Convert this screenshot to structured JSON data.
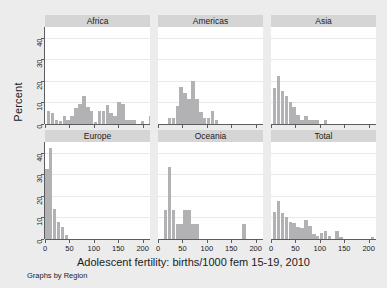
{
  "chart_data": {
    "type": "bar",
    "title": "",
    "xlabel": "Adolescent fertility: births/1000 fem 15-19, 2010",
    "ylabel": "Percent",
    "note": "Graphs by Region",
    "xlim": [
      0,
      215
    ],
    "ylim": [
      0,
      45
    ],
    "xticks": [
      0,
      50,
      100,
      150,
      200
    ],
    "xtick_labels": [
      "0",
      "50",
      "100",
      "150",
      "200"
    ],
    "yticks": [
      0,
      10,
      20,
      30,
      40
    ],
    "ytick_labels": [
      "0",
      "10",
      "20",
      "30",
      "40"
    ],
    "grid": true,
    "legend": "none",
    "layout": "2 rows x 3 columns of small-multiple histograms, shared axes, gray title strip above each panel",
    "bin_width": 8,
    "panels": [
      {
        "label": "Africa",
        "row": 0,
        "col": 0,
        "bins": [
          {
            "x": 8,
            "value": 6.0
          },
          {
            "x": 16,
            "value": 5.0
          },
          {
            "x": 24,
            "value": 2.0
          },
          {
            "x": 32,
            "value": 1.5
          },
          {
            "x": 40,
            "value": 3.5
          },
          {
            "x": 48,
            "value": 2.0
          },
          {
            "x": 56,
            "value": 3.5
          },
          {
            "x": 64,
            "value": 7.5
          },
          {
            "x": 72,
            "value": 9.5
          },
          {
            "x": 80,
            "value": 13.0
          },
          {
            "x": 88,
            "value": 8.0
          },
          {
            "x": 96,
            "value": 6.0
          },
          {
            "x": 104,
            "value": 1.0
          },
          {
            "x": 112,
            "value": 6.0
          },
          {
            "x": 120,
            "value": 6.0
          },
          {
            "x": 128,
            "value": 9.0
          },
          {
            "x": 136,
            "value": 5.0
          },
          {
            "x": 144,
            "value": 3.5
          },
          {
            "x": 152,
            "value": 10.0
          },
          {
            "x": 160,
            "value": 9.5
          },
          {
            "x": 168,
            "value": 2.0
          },
          {
            "x": 176,
            "value": 2.0
          },
          {
            "x": 184,
            "value": 2.0
          },
          {
            "x": 200,
            "value": 1.5
          },
          {
            "x": 216,
            "value": 3.5
          }
        ]
      },
      {
        "label": "Americas",
        "row": 0,
        "col": 1,
        "bins": [
          {
            "x": 24,
            "value": 3.0
          },
          {
            "x": 32,
            "value": 3.0
          },
          {
            "x": 40,
            "value": 8.5
          },
          {
            "x": 48,
            "value": 17.0
          },
          {
            "x": 56,
            "value": 14.5
          },
          {
            "x": 64,
            "value": 11.5
          },
          {
            "x": 72,
            "value": 20.0
          },
          {
            "x": 80,
            "value": 11.5
          },
          {
            "x": 88,
            "value": 5.5
          },
          {
            "x": 96,
            "value": 3.0
          },
          {
            "x": 104,
            "value": 3.0
          },
          {
            "x": 112,
            "value": 6.0
          },
          {
            "x": 120,
            "value": 2.0
          }
        ]
      },
      {
        "label": "Asia",
        "row": 0,
        "col": 2,
        "bins": [
          {
            "x": 8,
            "value": 16.5
          },
          {
            "x": 16,
            "value": 22.5
          },
          {
            "x": 24,
            "value": 15.5
          },
          {
            "x": 32,
            "value": 13.0
          },
          {
            "x": 40,
            "value": 10.0
          },
          {
            "x": 48,
            "value": 8.0
          },
          {
            "x": 56,
            "value": 4.0
          },
          {
            "x": 64,
            "value": 2.0
          },
          {
            "x": 72,
            "value": 3.5
          },
          {
            "x": 80,
            "value": 2.0
          },
          {
            "x": 88,
            "value": 2.0
          },
          {
            "x": 96,
            "value": 2.0
          },
          {
            "x": 112,
            "value": 2.0
          }
        ]
      },
      {
        "label": "Europe",
        "row": 1,
        "col": 0,
        "bins": [
          {
            "x": 4,
            "value": 32.5
          },
          {
            "x": 12,
            "value": 42.0
          },
          {
            "x": 20,
            "value": 14.0
          },
          {
            "x": 28,
            "value": 8.0
          },
          {
            "x": 36,
            "value": 5.5
          },
          {
            "x": 44,
            "value": 2.0
          }
        ]
      },
      {
        "label": "Oceania",
        "row": 1,
        "col": 1,
        "bins": [
          {
            "x": 16,
            "value": 13.5
          },
          {
            "x": 24,
            "value": 33.5
          },
          {
            "x": 32,
            "value": 13.5
          },
          {
            "x": 40,
            "value": 7.0
          },
          {
            "x": 48,
            "value": 7.0
          },
          {
            "x": 56,
            "value": 13.5
          },
          {
            "x": 64,
            "value": 13.5
          },
          {
            "x": 72,
            "value": 7.0
          },
          {
            "x": 80,
            "value": 7.0
          },
          {
            "x": 176,
            "value": 7.0
          }
        ]
      },
      {
        "label": "Total",
        "row": 1,
        "col": 2,
        "bins": [
          {
            "x": 8,
            "value": 12.5
          },
          {
            "x": 16,
            "value": 17.5
          },
          {
            "x": 24,
            "value": 12.0
          },
          {
            "x": 32,
            "value": 10.0
          },
          {
            "x": 40,
            "value": 8.0
          },
          {
            "x": 48,
            "value": 7.5
          },
          {
            "x": 56,
            "value": 5.5
          },
          {
            "x": 64,
            "value": 5.0
          },
          {
            "x": 72,
            "value": 9.0
          },
          {
            "x": 80,
            "value": 6.0
          },
          {
            "x": 88,
            "value": 2.5
          },
          {
            "x": 96,
            "value": 1.5
          },
          {
            "x": 104,
            "value": 3.0
          },
          {
            "x": 112,
            "value": 3.5
          },
          {
            "x": 120,
            "value": 1.5
          },
          {
            "x": 136,
            "value": 3.5
          },
          {
            "x": 144,
            "value": 1.0
          },
          {
            "x": 208,
            "value": 1.0
          }
        ]
      }
    ],
    "colors": {
      "bar": "#b2b2b4",
      "panel_background": "#ffffff",
      "figure_background": "#ececed",
      "strip_background": "#d5d5d6",
      "axis": "#5c5c5e",
      "gridline": "#e9e9ea",
      "text": "#1b1b1b"
    }
  }
}
